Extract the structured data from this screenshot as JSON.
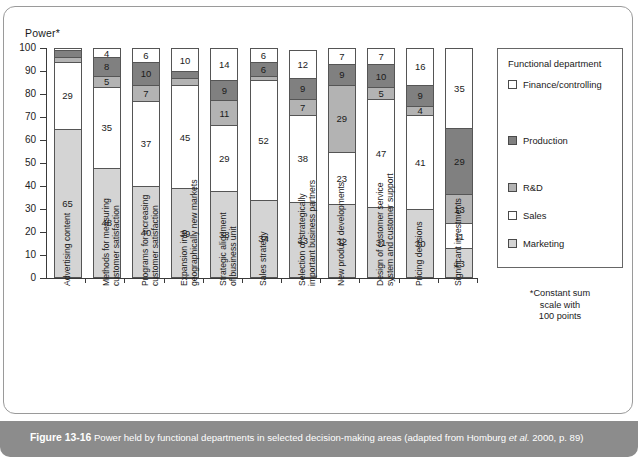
{
  "figure": {
    "caption_number": "Figure 13-16",
    "caption_text_a": "Power held by functional departments in selected decision-making areas (adapted from Homburg ",
    "caption_italic": "et al.",
    "caption_text_b": " 2000, p. 89)"
  },
  "axis": {
    "y_title": "Power*",
    "y_ticks": [
      "100",
      "90",
      "80",
      "70",
      "60",
      "50",
      "40",
      "30",
      "20",
      "10",
      "0"
    ],
    "y_min": 0,
    "y_max": 100
  },
  "legend": {
    "title": "Functional department",
    "items": [
      {
        "label": "Finance/controlling",
        "color": "#ffffff"
      },
      {
        "label": "Production",
        "color": "#808080"
      },
      {
        "label": "R&D",
        "color": "#b3b3b3"
      },
      {
        "label": "Sales",
        "color": "#ffffff"
      },
      {
        "label": "Marketing",
        "color": "#d4d4d4"
      }
    ]
  },
  "footnote": "*Constant sum\nscale with\n100 points",
  "chart_data": {
    "type": "bar",
    "subtype": "stacked-vertical-100",
    "title": "Power held by functional departments in selected decision-making areas",
    "xlabel": "",
    "ylabel": "Power*",
    "ylim": [
      0,
      100
    ],
    "grid": false,
    "legend_position": "right",
    "categories": [
      "Advertising content",
      "Methods for measuring\ncustomer satisfaction",
      "Programs for increasing\ncustomer satisfaction",
      "Expansion into\ngeographically new markets",
      "Strategic alignment\nof business unit",
      "Sales strategy",
      "Selection of strategically\nimportant business partners",
      "New product developments",
      "Design of customer service\nsystem and customer support",
      "Pricing decisions",
      "Significant investments"
    ],
    "series": [
      {
        "name": "Marketing",
        "color": "#d4d4d4",
        "values": [
          65,
          48,
          40,
          39,
          38,
          34,
          33,
          32,
          31,
          30,
          13
        ]
      },
      {
        "name": "Sales",
        "color": "#ffffff",
        "values": [
          29,
          35,
          37,
          45,
          29,
          52,
          38,
          23,
          47,
          41,
          11
        ]
      },
      {
        "name": "R&D",
        "color": "#b3b3b3",
        "values": [
          2,
          5,
          7,
          3,
          11,
          2,
          7,
          29,
          5,
          4,
          13
        ]
      },
      {
        "name": "Production",
        "color": "#808080",
        "values": [
          3,
          8,
          10,
          3,
          9,
          6,
          9,
          9,
          10,
          9,
          29
        ]
      },
      {
        "name": "Finance/controlling",
        "color": "#ffffff",
        "values": [
          1,
          4,
          6,
          10,
          14,
          6,
          12,
          7,
          7,
          16,
          35
        ]
      }
    ],
    "labels": [
      {
        "name": "Marketing",
        "values": [
          "65",
          "48",
          "40",
          "39",
          "38",
          "34",
          "33",
          "32",
          "31",
          "30",
          "13"
        ]
      },
      {
        "name": "Sales",
        "values": [
          "29",
          "35",
          "37",
          "45",
          "29",
          "52",
          "38",
          "23",
          "47",
          "41",
          "11"
        ]
      },
      {
        "name": "R&D",
        "values": [
          "",
          "5",
          "7",
          "",
          "11",
          "",
          "7",
          "29",
          "5",
          "4",
          "13"
        ]
      },
      {
        "name": "Production",
        "values": [
          "",
          "8",
          "10",
          "",
          "9",
          "6",
          "9",
          "9",
          "10",
          "9",
          "29"
        ]
      },
      {
        "name": "Finance/controlling",
        "values": [
          "",
          "4",
          "6",
          "10",
          "14",
          "6",
          "12",
          "7",
          "7",
          "16",
          "35"
        ]
      }
    ]
  }
}
